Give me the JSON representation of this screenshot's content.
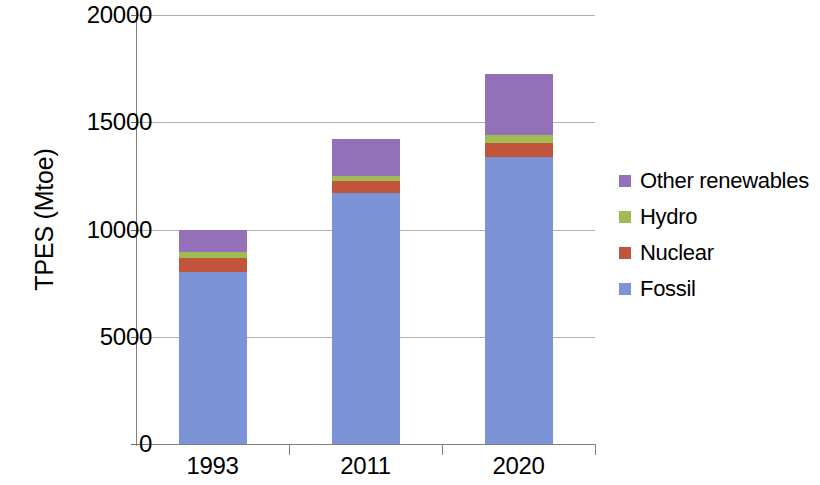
{
  "chart_data": {
    "type": "bar",
    "stacked": true,
    "title": "",
    "xlabel": "",
    "ylabel": "TPES (Mtoe)",
    "categories": [
      "1993",
      "2011",
      "2020"
    ],
    "ylim": [
      0,
      20000
    ],
    "yticks": [
      0,
      5000,
      10000,
      15000,
      20000
    ],
    "ytick_labels": [
      "0",
      "5000",
      "10000",
      "15000",
      "20000"
    ],
    "grid": "horizontal",
    "legend_position": "right",
    "series": [
      {
        "name": "Fossil",
        "color": "#7C93D8",
        "values": [
          8020,
          11700,
          13380
        ]
      },
      {
        "name": "Nuclear",
        "color": "#C1553C",
        "values": [
          650,
          560,
          650
        ]
      },
      {
        "name": "Hydro",
        "color": "#9FBC52",
        "values": [
          280,
          230,
          370
        ]
      },
      {
        "name": "Other renewables",
        "color": "#9370B8",
        "values": [
          1050,
          1710,
          2850
        ]
      }
    ],
    "totals": [
      10000,
      14200,
      17250
    ]
  },
  "axes": {
    "y_title": "TPES (Mtoe)",
    "y_ticks": [
      "20000",
      "15000",
      "10000",
      "5000",
      "0"
    ],
    "x_ticks": [
      "1993",
      "2011",
      "2020"
    ]
  },
  "legend": {
    "items": [
      {
        "label": "Other renewables",
        "color": "#9370B8"
      },
      {
        "label": "Hydro",
        "color": "#9FBC52"
      },
      {
        "label": "Nuclear",
        "color": "#C1553C"
      },
      {
        "label": "Fossil",
        "color": "#7C93D8"
      }
    ]
  }
}
